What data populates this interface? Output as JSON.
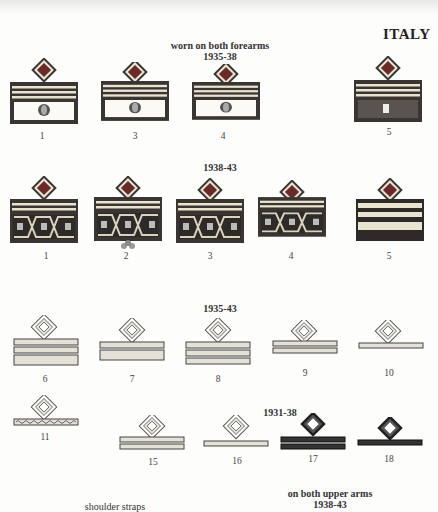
{
  "page": {
    "country_title": "ITALY",
    "sections": [
      {
        "id": "forearms_1935_38",
        "heading_line1": "worn on both forearms",
        "heading_line2": "1935-38",
        "items": [
          {
            "label": "1",
            "style": "cuff-eagle-red-diamond"
          },
          {
            "label": "3",
            "style": "cuff-eagle-red-diamond"
          },
          {
            "label": "4",
            "style": "cuff-eagle-red-diamond"
          },
          {
            "label": "5",
            "style": "cuff-dark-fasces"
          }
        ]
      },
      {
        "id": "1938_43",
        "heading_line1": "1938-43",
        "items": [
          {
            "label": "1",
            "style": "cuff-greek-key"
          },
          {
            "label": "2",
            "style": "cuff-greek-key-crown"
          },
          {
            "label": "3",
            "style": "cuff-greek-key"
          },
          {
            "label": "4",
            "style": "cuff-greek-key"
          },
          {
            "label": "5",
            "style": "cuff-stripes-dark"
          }
        ]
      },
      {
        "id": "1935_43",
        "heading_line1": "1935-43",
        "items": [
          {
            "label": "6",
            "style": "chevron-3-bars"
          },
          {
            "label": "7",
            "style": "chevron-2-bars"
          },
          {
            "label": "8",
            "style": "chevron-3-bars"
          },
          {
            "label": "9",
            "style": "chevron-2-thin-bars"
          },
          {
            "label": "10",
            "style": "chevron-1-bar"
          },
          {
            "label": "11",
            "style": "chevron-1-wavy-bar"
          }
        ]
      },
      {
        "id": "1931_38",
        "heading_line1": "1931-38",
        "items": [
          {
            "label": "15",
            "style": "light-2-bars"
          },
          {
            "label": "16",
            "style": "light-1-bar"
          },
          {
            "label": "17",
            "style": "dark-2-bars"
          },
          {
            "label": "18",
            "style": "dark-1-bar"
          }
        ]
      },
      {
        "id": "upper_arms",
        "heading_line1": "on both upper arms",
        "heading_line2": "1938-43"
      },
      {
        "id": "shoulder_straps",
        "heading_line1": "shoulder straps"
      }
    ],
    "colors": {
      "red_diamond": "#6a2a2a",
      "gold": "#e9e4cf",
      "dark": "#2e2a28",
      "light_bar": "#e4e1d6"
    }
  }
}
